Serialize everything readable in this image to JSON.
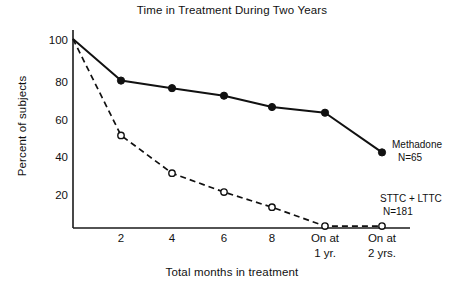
{
  "chart_data": {
    "type": "line",
    "title": "Time in Treatment During Two Years",
    "xlabel": "Total months in treatment",
    "ylabel": "Percent of subjects",
    "categories": [
      "0",
      "2",
      "4",
      "6",
      "8",
      "On at 1 yr.",
      "On at 2 yrs."
    ],
    "x_tick_labels": [
      "2",
      "4",
      "6",
      "8",
      "On at\n1 yr.",
      "On at\n2 yrs."
    ],
    "x_ticks": [
      {
        "label_line1": "2",
        "label_line2": ""
      },
      {
        "label_line1": "4",
        "label_line2": ""
      },
      {
        "label_line1": "6",
        "label_line2": ""
      },
      {
        "label_line1": "8",
        "label_line2": ""
      },
      {
        "label_line1": "On at",
        "label_line2": "1 yr."
      },
      {
        "label_line1": "On at",
        "label_line2": "2 yrs."
      }
    ],
    "y_ticks": [
      "100",
      "80",
      "60",
      "40",
      "20"
    ],
    "ylim": [
      0,
      100
    ],
    "grid": false,
    "legend_position": "inline-right",
    "series": [
      {
        "name": "Methadone",
        "n_label": "N=65",
        "marker": "filled-circle",
        "line_style": "solid",
        "color": "#111111",
        "values": [
          100,
          78,
          74,
          70,
          64,
          61,
          40
        ]
      },
      {
        "name": "STTC + LTTC",
        "n_label": "N=181",
        "marker": "open-circle",
        "line_style": "dashed",
        "color": "#111111",
        "values": [
          100,
          49,
          29,
          19,
          11,
          1,
          1
        ]
      }
    ]
  },
  "colors": {
    "background": "#ffffff",
    "ink": "#111111",
    "axis": "#1a1a1a"
  }
}
